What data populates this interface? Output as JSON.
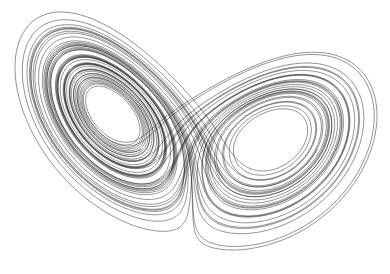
{
  "figure": {
    "title": "Lorenz attractor",
    "background": "#ffffff",
    "stroke_color": "#000000",
    "stroke_width": 0.5,
    "stroke_opacity": 0.85
  },
  "lorenz": {
    "sigma": 10,
    "rho": 28,
    "beta": 2.6667,
    "x0": 0.5,
    "y0": 0.5,
    "z0": 10,
    "dt": 0.004,
    "steps": 14000,
    "skip": 200
  },
  "projection": {
    "left_lobe_center": [
      124,
      148
    ],
    "right_lobe_center": [
      265,
      125
    ],
    "x_range": [
      15,
      377
    ],
    "y_range": [
      12,
      250
    ]
  }
}
